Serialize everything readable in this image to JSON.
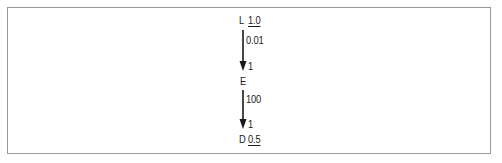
{
  "diagram": {
    "nodes": [
      {
        "id": "L",
        "label": "L",
        "value": "1.0",
        "value_underlined": true
      },
      {
        "id": "E",
        "label": "E",
        "value": "",
        "value_underlined": false
      },
      {
        "id": "D",
        "label": "D",
        "value": "0.5",
        "value_underlined": true
      }
    ],
    "edges": [
      {
        "from": "L",
        "to": "E",
        "source_label": "0.01",
        "target_label": "1"
      },
      {
        "from": "E",
        "to": "D",
        "source_label": "100",
        "target_label": "1"
      }
    ],
    "colors": {
      "frame_border": "#9a9a9a",
      "ink": "#1a1a1a",
      "background": "#ffffff"
    }
  }
}
